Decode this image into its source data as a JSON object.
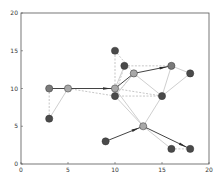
{
  "chart_data": {
    "type": "scatter",
    "subtype": "network-graph",
    "title": "",
    "xlabel": "",
    "ylabel": "",
    "xlim": [
      0,
      20
    ],
    "ylim": [
      0,
      20
    ],
    "grid": false,
    "legend": null,
    "x_ticks": [
      "0",
      "5",
      "10",
      "15",
      "20"
    ],
    "y_ticks": [
      "0",
      "5",
      "10",
      "15",
      "20"
    ],
    "nodes": [
      {
        "id": "A",
        "x": 3,
        "y": 10,
        "shade": "mid"
      },
      {
        "id": "B",
        "x": 5,
        "y": 10,
        "shade": "light"
      },
      {
        "id": "C",
        "x": 3,
        "y": 6,
        "shade": "dark"
      },
      {
        "id": "D",
        "x": 10,
        "y": 10,
        "shade": "light"
      },
      {
        "id": "E",
        "x": 10,
        "y": 9,
        "shade": "dark"
      },
      {
        "id": "F",
        "x": 10,
        "y": 15,
        "shade": "dark"
      },
      {
        "id": "G",
        "x": 11,
        "y": 13,
        "shade": "dark"
      },
      {
        "id": "H",
        "x": 12,
        "y": 12,
        "shade": "light"
      },
      {
        "id": "I",
        "x": 16,
        "y": 13,
        "shade": "mid"
      },
      {
        "id": "J",
        "x": 18,
        "y": 12,
        "shade": "dark"
      },
      {
        "id": "K",
        "x": 15,
        "y": 9,
        "shade": "dark"
      },
      {
        "id": "L",
        "x": 13,
        "y": 5,
        "shade": "light"
      },
      {
        "id": "M",
        "x": 9,
        "y": 3,
        "shade": "dark"
      },
      {
        "id": "N",
        "x": 16,
        "y": 2,
        "shade": "dark"
      },
      {
        "id": "O",
        "x": 18,
        "y": 2,
        "shade": "dark"
      }
    ],
    "directed_edges": [
      {
        "from": "A",
        "to": "B",
        "style": "solid-dark"
      },
      {
        "from": "B",
        "to": "D",
        "style": "solid-dark-arrow"
      },
      {
        "from": "D",
        "to": "H",
        "style": "solid-dark"
      },
      {
        "from": "H",
        "to": "I",
        "style": "solid-dark-arrow"
      },
      {
        "from": "M",
        "to": "L",
        "style": "solid-dark-arrow"
      },
      {
        "from": "L",
        "to": "O",
        "style": "solid-dark-arrow"
      }
    ],
    "light_edges": [
      {
        "from": "B",
        "to": "C"
      },
      {
        "from": "D",
        "to": "L"
      },
      {
        "from": "E",
        "to": "L"
      },
      {
        "from": "H",
        "to": "K"
      },
      {
        "from": "K",
        "to": "L"
      },
      {
        "from": "I",
        "to": "K"
      },
      {
        "from": "J",
        "to": "K"
      },
      {
        "from": "I",
        "to": "J"
      },
      {
        "from": "L",
        "to": "N"
      },
      {
        "from": "D",
        "to": "G"
      },
      {
        "from": "E",
        "to": "H"
      }
    ],
    "dashed_edges": [
      {
        "from": "A",
        "to": "C"
      },
      {
        "from": "B",
        "to": "E"
      },
      {
        "from": "D",
        "to": "F"
      },
      {
        "from": "F",
        "to": "H"
      },
      {
        "from": "G",
        "to": "I"
      },
      {
        "from": "D",
        "to": "K"
      },
      {
        "from": "E",
        "to": "K"
      },
      {
        "from": "H",
        "to": "E"
      },
      {
        "from": "G",
        "to": "E"
      },
      {
        "from": "N",
        "to": "O"
      }
    ]
  },
  "colors": {
    "node_dark": "#4a4a4a",
    "node_mid": "#7a7a7a",
    "node_light": "#a8a8a8",
    "edge_dark": "#2e2e2e",
    "edge_light": "#cfcfcf",
    "edge_dashed": "#a0a0a0",
    "axis": "#555555"
  }
}
